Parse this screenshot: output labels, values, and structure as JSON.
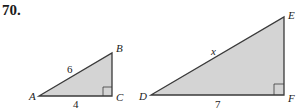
{
  "problem": {
    "number": "70."
  },
  "triangles": [
    {
      "name": "ABC",
      "vertices": {
        "A": "A",
        "B": "B",
        "C": "C"
      },
      "right_angle_at": "C",
      "sides": {
        "hypotenuse_AB": "6",
        "leg_AC": "4"
      }
    },
    {
      "name": "DEF",
      "vertices": {
        "D": "D",
        "E": "E",
        "F": "F"
      },
      "right_angle_at": "F",
      "sides": {
        "hypotenuse_DE": "x",
        "leg_DF": "7"
      }
    }
  ],
  "colors": {
    "fill": "#d4d4d4",
    "stroke": "#3a3a3a"
  }
}
